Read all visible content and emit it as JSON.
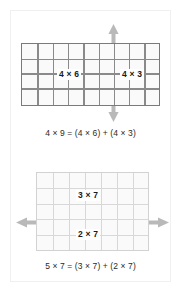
{
  "figure": {
    "colors": {
      "background": "#ffffff",
      "grid_strong_line": "#7a7a7a",
      "grid_light_line": "#d8d8d8",
      "grid_fill": "#fafafa",
      "arrow": "#b5b5b5",
      "text": "#1a1a1a",
      "equation_text": "#2a2a2a",
      "page_frame": "#f0f0f0"
    }
  },
  "panels": [
    {
      "id": "top",
      "name": "four-by-nine-array",
      "grid": {
        "columns": 9,
        "rows": 4,
        "style": "strong"
      },
      "split": {
        "orientation": "vertical",
        "after_column": 6,
        "arrow": "double-headed-vertical-arrow"
      },
      "labels": [
        {
          "name": "left-part-label",
          "text": "4 × 6"
        },
        {
          "name": "right-part-label",
          "text": "4 × 3"
        }
      ],
      "equation": {
        "name": "top-equation",
        "text": "4 × 9 = (4 × 6) + (4 × 3)"
      }
    },
    {
      "id": "bottom",
      "name": "five-by-seven-array",
      "grid": {
        "columns": 7,
        "rows": 5,
        "style": "light"
      },
      "split": {
        "orientation": "horizontal",
        "after_row": 3,
        "arrow": "double-headed-horizontal-arrow"
      },
      "labels": [
        {
          "name": "upper-part-label",
          "text": "3 × 7"
        },
        {
          "name": "lower-part-label",
          "text": "2 × 7"
        }
      ],
      "equation": {
        "name": "bottom-equation",
        "text": "5 × 7 = (3 × 7) + (2 × 7)"
      }
    }
  ]
}
